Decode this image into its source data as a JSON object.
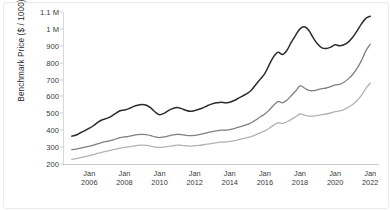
{
  "chart_data": {
    "type": "line",
    "title": "",
    "xlabel": "",
    "ylabel": "Benchmark Price ($ / 1000)",
    "ylim": [
      200,
      1100
    ],
    "xlim": [
      2004.5,
      2022.5
    ],
    "grid": false,
    "legend": "none",
    "ytick_labels": [
      "1.1 M",
      "1 M",
      "900",
      "800",
      "700",
      "600",
      "500",
      "400",
      "300",
      "200"
    ],
    "ytick_values": [
      1100,
      1000,
      900,
      800,
      700,
      600,
      500,
      400,
      300,
      200
    ],
    "xtick_labels": [
      {
        "month": "Jan",
        "year": "2006"
      },
      {
        "month": "Jan",
        "year": "2008"
      },
      {
        "month": "Jan",
        "year": "2010"
      },
      {
        "month": "Jan",
        "year": "2012"
      },
      {
        "month": "Jan",
        "year": "2014"
      },
      {
        "month": "Jan",
        "year": "2016"
      },
      {
        "month": "Jan",
        "year": "2018"
      },
      {
        "month": "Jan",
        "year": "2020"
      },
      {
        "month": "Jan",
        "year": "2022"
      }
    ],
    "xtick_values": [
      2006,
      2008,
      2010,
      2012,
      2014,
      2016,
      2018,
      2020,
      2022
    ],
    "colors": {
      "series_top": "#2b2b2b",
      "series_middle": "#808080",
      "series_bottom": "#b3b3b3",
      "axis": "#cccccc",
      "text": "#333333",
      "background": "#ffffff"
    },
    "series": [
      {
        "name": "series_top",
        "color": "#2b2b2b",
        "width": 1.5,
        "x": [
          2005.0,
          2005.25,
          2005.5,
          2005.75,
          2006.0,
          2006.25,
          2006.5,
          2006.75,
          2007.0,
          2007.25,
          2007.5,
          2007.75,
          2008.0,
          2008.25,
          2008.5,
          2008.75,
          2009.0,
          2009.25,
          2009.5,
          2009.75,
          2010.0,
          2010.25,
          2010.5,
          2010.75,
          2011.0,
          2011.25,
          2011.5,
          2011.75,
          2012.0,
          2012.25,
          2012.5,
          2012.75,
          2013.0,
          2013.25,
          2013.5,
          2013.75,
          2014.0,
          2014.25,
          2014.5,
          2014.75,
          2015.0,
          2015.25,
          2015.5,
          2015.75,
          2016.0,
          2016.25,
          2016.5,
          2016.75,
          2017.0,
          2017.25,
          2017.5,
          2017.75,
          2018.0,
          2018.25,
          2018.5,
          2018.75,
          2019.0,
          2019.25,
          2019.5,
          2019.75,
          2020.0,
          2020.25,
          2020.5,
          2020.75,
          2021.0,
          2021.25,
          2021.5,
          2021.75,
          2022.0
        ],
        "y": [
          365,
          372,
          385,
          398,
          412,
          428,
          448,
          462,
          470,
          482,
          500,
          515,
          520,
          528,
          540,
          548,
          552,
          548,
          532,
          508,
          492,
          500,
          516,
          528,
          534,
          528,
          518,
          512,
          516,
          524,
          534,
          546,
          556,
          562,
          566,
          562,
          566,
          576,
          590,
          604,
          618,
          640,
          672,
          704,
          736,
          788,
          836,
          862,
          848,
          872,
          920,
          962,
          1000,
          1012,
          992,
          948,
          910,
          888,
          884,
          892,
          906,
          900,
          906,
          922,
          950,
          988,
          1030,
          1062,
          1075
        ]
      },
      {
        "name": "series_middle",
        "color": "#808080",
        "width": 1.3,
        "x": [
          2005.0,
          2005.25,
          2005.5,
          2005.75,
          2006.0,
          2006.25,
          2006.5,
          2006.75,
          2007.0,
          2007.25,
          2007.5,
          2007.75,
          2008.0,
          2008.25,
          2008.5,
          2008.75,
          2009.0,
          2009.25,
          2009.5,
          2009.75,
          2010.0,
          2010.25,
          2010.5,
          2010.75,
          2011.0,
          2011.25,
          2011.5,
          2011.75,
          2012.0,
          2012.25,
          2012.5,
          2012.75,
          2013.0,
          2013.25,
          2013.5,
          2013.75,
          2014.0,
          2014.25,
          2014.5,
          2014.75,
          2015.0,
          2015.25,
          2015.5,
          2015.75,
          2016.0,
          2016.25,
          2016.5,
          2016.75,
          2017.0,
          2017.25,
          2017.5,
          2017.75,
          2018.0,
          2018.25,
          2018.5,
          2018.75,
          2019.0,
          2019.25,
          2019.5,
          2019.75,
          2020.0,
          2020.25,
          2020.5,
          2020.75,
          2021.0,
          2021.25,
          2021.5,
          2021.75,
          2022.0
        ],
        "y": [
          285,
          288,
          294,
          300,
          306,
          312,
          320,
          328,
          334,
          340,
          348,
          356,
          360,
          364,
          370,
          374,
          376,
          374,
          368,
          360,
          356,
          360,
          366,
          372,
          376,
          374,
          370,
          368,
          370,
          374,
          380,
          386,
          392,
          396,
          400,
          400,
          404,
          410,
          418,
          426,
          434,
          446,
          462,
          480,
          496,
          520,
          548,
          570,
          562,
          578,
          604,
          632,
          662,
          650,
          636,
          634,
          640,
          646,
          650,
          658,
          668,
          672,
          684,
          704,
          730,
          766,
          812,
          870,
          910
        ]
      },
      {
        "name": "series_bottom",
        "color": "#b3b3b3",
        "width": 1.3,
        "x": [
          2005.0,
          2005.25,
          2005.5,
          2005.75,
          2006.0,
          2006.25,
          2006.5,
          2006.75,
          2007.0,
          2007.25,
          2007.5,
          2007.75,
          2008.0,
          2008.25,
          2008.5,
          2008.75,
          2009.0,
          2009.25,
          2009.5,
          2009.75,
          2010.0,
          2010.25,
          2010.5,
          2010.75,
          2011.0,
          2011.25,
          2011.5,
          2011.75,
          2012.0,
          2012.25,
          2012.5,
          2012.75,
          2013.0,
          2013.25,
          2013.5,
          2013.75,
          2014.0,
          2014.25,
          2014.5,
          2014.75,
          2015.0,
          2015.25,
          2015.5,
          2015.75,
          2016.0,
          2016.25,
          2016.5,
          2016.75,
          2017.0,
          2017.25,
          2017.5,
          2017.75,
          2018.0,
          2018.25,
          2018.5,
          2018.75,
          2019.0,
          2019.25,
          2019.5,
          2019.75,
          2020.0,
          2020.25,
          2020.5,
          2020.75,
          2021.0,
          2021.25,
          2021.5,
          2021.75,
          2022.0
        ],
        "y": [
          228,
          232,
          238,
          244,
          250,
          256,
          264,
          270,
          276,
          282,
          288,
          294,
          298,
          302,
          306,
          310,
          312,
          310,
          306,
          300,
          298,
          300,
          304,
          308,
          312,
          310,
          308,
          306,
          308,
          310,
          314,
          318,
          322,
          326,
          330,
          330,
          334,
          338,
          344,
          350,
          356,
          364,
          374,
          386,
          396,
          412,
          430,
          444,
          440,
          450,
          464,
          480,
          496,
          490,
          484,
          484,
          488,
          492,
          496,
          502,
          510,
          514,
          522,
          536,
          552,
          576,
          606,
          648,
          678
        ]
      }
    ]
  }
}
